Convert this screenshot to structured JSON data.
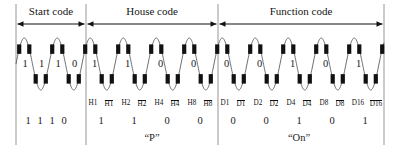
{
  "figure": {
    "background_color": "#ffffff",
    "line_color": "#555555",
    "burst_color": "#111111",
    "text_color": "#1a1a1a",
    "width": 401,
    "height": 149
  },
  "sections": [
    {
      "id": "start-code",
      "label": "Start code",
      "x_start": 16,
      "x_end": 86
    },
    {
      "id": "house-code",
      "label": "House code",
      "x_start": 86,
      "x_end": 218
    },
    {
      "id": "function-code",
      "label": "Function code",
      "x_start": 218,
      "x_end": 384
    }
  ],
  "dividers": [
    16,
    86,
    218,
    384
  ],
  "waveform": {
    "baseline_y": 64,
    "amplitude": 26,
    "half_cycle_width": 16.5,
    "burst_width": 4.2,
    "burst_height": 9.5,
    "description": "60 Hz sine carrier with 120 kHz burst markers at each zero crossing"
  },
  "inline_bits": {
    "start_code": [
      {
        "value": "1",
        "x": 22.5
      },
      {
        "value": "1",
        "x": 39.0
      },
      {
        "value": "1",
        "x": 55.5
      },
      {
        "value": "0",
        "x": 72.0
      }
    ],
    "house_code": [
      {
        "value": "1",
        "x": 92.0
      },
      {
        "value": "1",
        "x": 125.0
      },
      {
        "value": "0",
        "x": 158.0
      },
      {
        "value": "0",
        "x": 191.0
      }
    ],
    "function_code": [
      {
        "value": "0",
        "x": 224.0
      },
      {
        "value": "0",
        "x": 257.0
      },
      {
        "value": "1",
        "x": 290.0
      },
      {
        "value": "0",
        "x": 323.0
      },
      {
        "value": "1",
        "x": 356.0
      }
    ]
  },
  "pin_labels": {
    "house_code": [
      {
        "text": "H1",
        "overline": false,
        "x": 93
      },
      {
        "text": "H1",
        "overline": true,
        "x": 109
      },
      {
        "text": "H2",
        "overline": false,
        "x": 126
      },
      {
        "text": "H2",
        "overline": true,
        "x": 142
      },
      {
        "text": "H4",
        "overline": false,
        "x": 159
      },
      {
        "text": "H4",
        "overline": true,
        "x": 175
      },
      {
        "text": "H8",
        "overline": false,
        "x": 192
      },
      {
        "text": "H8",
        "overline": true,
        "x": 208
      }
    ],
    "function_code": [
      {
        "text": "D1",
        "overline": false,
        "x": 225
      },
      {
        "text": "D1",
        "overline": true,
        "x": 241
      },
      {
        "text": "D2",
        "overline": false,
        "x": 258
      },
      {
        "text": "D2",
        "overline": true,
        "x": 274
      },
      {
        "text": "D4",
        "overline": false,
        "x": 291
      },
      {
        "text": "D4",
        "overline": true,
        "x": 307
      },
      {
        "text": "D8",
        "overline": false,
        "x": 324
      },
      {
        "text": "D8",
        "overline": true,
        "x": 340
      },
      {
        "text": "D16",
        "overline": false,
        "x": 358
      },
      {
        "text": "D16",
        "overline": true,
        "x": 376
      }
    ]
  },
  "decoded_rows": {
    "start_code": {
      "digits": [
        {
          "value": "1",
          "x": 28
        },
        {
          "value": "1",
          "x": 40
        },
        {
          "value": "1",
          "x": 52
        },
        {
          "value": "0",
          "x": 64
        }
      ],
      "caption": ""
    },
    "house_code": {
      "digits": [
        {
          "value": "1",
          "x": 101
        },
        {
          "value": "1",
          "x": 134
        },
        {
          "value": "0",
          "x": 167
        },
        {
          "value": "0",
          "x": 200
        }
      ],
      "caption": "“P”",
      "caption_x": 152
    },
    "function_code": {
      "digits": [
        {
          "value": "0",
          "x": 233
        },
        {
          "value": "0",
          "x": 266
        },
        {
          "value": "1",
          "x": 299
        },
        {
          "value": "0",
          "x": 332
        },
        {
          "value": "1",
          "x": 365
        }
      ],
      "caption": "“On”",
      "caption_x": 299
    }
  }
}
